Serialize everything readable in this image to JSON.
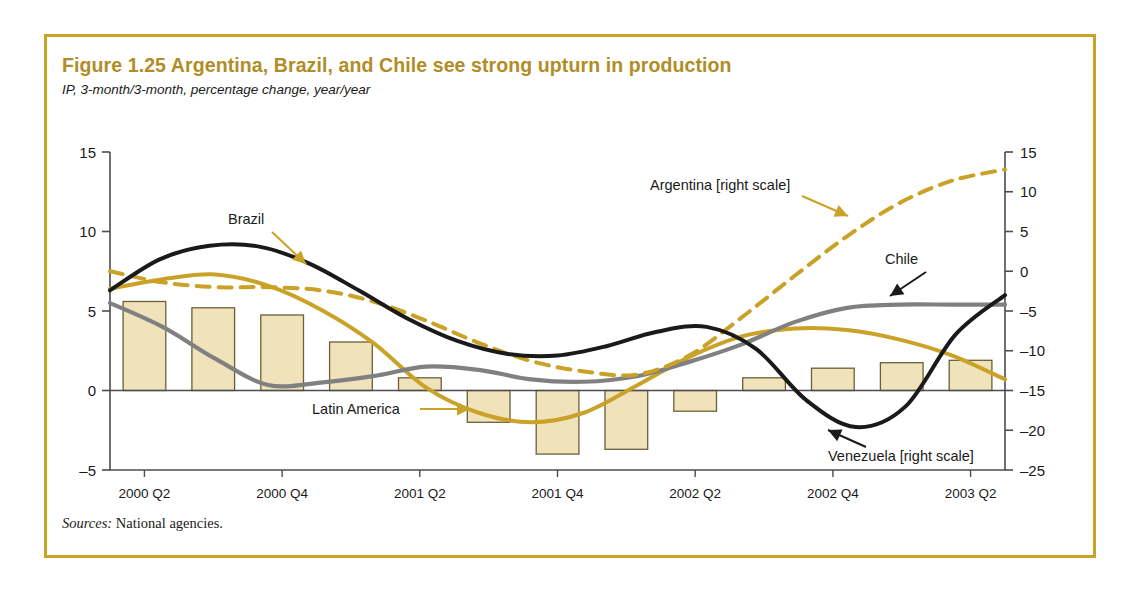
{
  "figure": {
    "title": "Figure 1.25  Argentina, Brazil, and Chile see strong upturn in production",
    "subtitle": "IP, 3-month/3-month, percentage change, year/year",
    "sources_label": "Sources:",
    "sources_text": " National agencies."
  },
  "colors": {
    "frame": "#c9a227",
    "title": "#b08d26",
    "gold": "#c9a227",
    "black": "#1a1a1a",
    "gray": "#808080",
    "bar_fill": "#f0e3bb",
    "bar_stroke": "#6b5f35",
    "axis": "#4d4d4d"
  },
  "annotations": [
    {
      "name": "argentina",
      "label": "Argentina [right scale]",
      "x": 650,
      "y": 190,
      "arrow_color": "#c9a227"
    },
    {
      "name": "brazil",
      "label": "Brazil",
      "x": 228,
      "y": 224,
      "arrow_color": "#c9a227"
    },
    {
      "name": "chile",
      "label": "Chile",
      "x": 885,
      "y": 264,
      "arrow_color": "#1a1a1a"
    },
    {
      "name": "latin-america",
      "label": "Latin America",
      "x": 312,
      "y": 414,
      "arrow_color": "#c9a227"
    },
    {
      "name": "venezuela",
      "label": "Venezuela [right scale]",
      "x": 828,
      "y": 461,
      "arrow_color": "#1a1a1a"
    }
  ],
  "chart_data": {
    "type": "line",
    "title": "Figure 1.25  Argentina, Brazil, and Chile see strong upturn in production",
    "subtitle": "IP, 3-month/3-month, percentage change, year/year",
    "xlabel": "",
    "ylabel": "",
    "grid": false,
    "legend": "annotations",
    "x_tick_labels": [
      "2000 Q2",
      "2000 Q4",
      "2001 Q2",
      "2001 Q4",
      "2002 Q2",
      "2002 Q4",
      "2003 Q2"
    ],
    "x_tick_index": [
      0,
      2,
      4,
      6,
      8,
      10,
      12
    ],
    "left_axis": {
      "ticks": [
        15,
        10,
        5,
        0,
        -5
      ],
      "ylim": [
        -5,
        15
      ],
      "applies_to": [
        "Latin America",
        "Brazil",
        "Chile"
      ]
    },
    "right_axis": {
      "ticks": [
        15,
        10,
        5,
        0,
        -5,
        -10,
        -15,
        -20,
        -25
      ],
      "ylim": [
        -25,
        15
      ],
      "applies_to": [
        "Argentina",
        "Venezuela"
      ]
    },
    "series": [
      {
        "name": "Latin America",
        "type": "bar",
        "axis": "left",
        "color": "#f0e3bb",
        "stroke": "#6b5f35",
        "values": [
          5.6,
          5.2,
          4.75,
          3.05,
          0.8,
          -2.0,
          -4.0,
          -3.7,
          -1.3,
          0.8,
          1.4,
          1.75,
          1.9
        ]
      },
      {
        "name": "Brazil",
        "type": "line",
        "axis": "left",
        "style": "solid",
        "color": "#c9a227",
        "values": [
          6.4,
          7.0,
          7.3,
          6.6,
          5.1,
          3.0,
          0.2,
          -1.4,
          -2.0,
          -1.4,
          0.3,
          2.1,
          3.4,
          3.9,
          3.8,
          3.2,
          2.2,
          0.7
        ]
      },
      {
        "name": "Chile",
        "type": "line",
        "axis": "left",
        "style": "solid",
        "color": "#808080",
        "values": [
          5.5,
          4.0,
          2.0,
          0.35,
          0.5,
          0.9,
          1.5,
          1.3,
          0.7,
          0.55,
          0.9,
          1.8,
          2.9,
          4.3,
          5.2,
          5.4,
          5.4,
          5.4
        ]
      },
      {
        "name": "Argentina",
        "type": "line",
        "axis": "right",
        "style": "dashed",
        "color": "#c9a227",
        "values": [
          0.0,
          -1.4,
          -2.0,
          -2.0,
          -2.4,
          -3.8,
          -6.2,
          -9.0,
          -11.3,
          -12.6,
          -13.0,
          -10.6,
          -5.8,
          -0.6,
          4.4,
          8.6,
          11.4,
          12.8
        ]
      },
      {
        "name": "Venezuela",
        "type": "line",
        "axis": "right",
        "style": "solid",
        "color": "#1a1a1a",
        "values": [
          -2.4,
          1.5,
          3.2,
          3.1,
          1.0,
          -2.4,
          -6.0,
          -8.8,
          -10.4,
          -10.6,
          -9.4,
          -7.6,
          -7.0,
          -9.8,
          -16.2,
          -19.6,
          -17.0,
          -8.0,
          -3.0
        ]
      }
    ]
  }
}
